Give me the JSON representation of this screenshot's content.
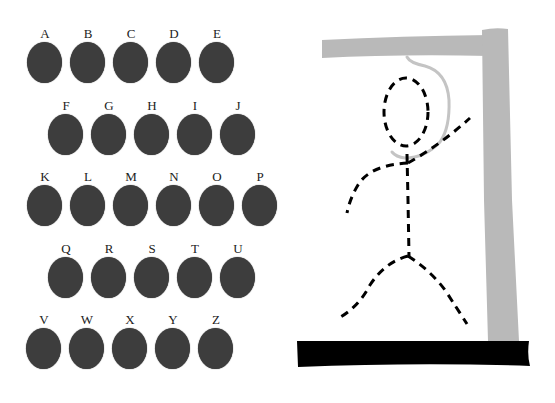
{
  "game": "hangman",
  "keyboard": {
    "rows": [
      {
        "offset_x": 27,
        "top": 27,
        "letters": [
          "A",
          "B",
          "C",
          "D",
          "E"
        ]
      },
      {
        "offset_x": 48,
        "top": 99,
        "letters": [
          "F",
          "G",
          "H",
          "I",
          "J"
        ]
      },
      {
        "offset_x": 27,
        "top": 170,
        "letters": [
          "K",
          "L",
          "M",
          "N",
          "O",
          "P"
        ]
      },
      {
        "offset_x": 48,
        "top": 242,
        "letters": [
          "Q",
          "R",
          "S",
          "T",
          "U"
        ]
      },
      {
        "offset_x": 26,
        "top": 313,
        "letters": [
          "V",
          "W",
          "X",
          "Y",
          "Z"
        ]
      }
    ],
    "key_spacing": 43,
    "key_color": "#3d3d3d"
  },
  "gallows": {
    "post_color": "#b9b9b9",
    "rope_color": "#c4c4c4",
    "base_color": "#000000",
    "figure_color": "#000000",
    "figure_parts_drawn": [
      "head",
      "body",
      "left-arm",
      "right-arm",
      "left-leg",
      "right-leg"
    ]
  }
}
